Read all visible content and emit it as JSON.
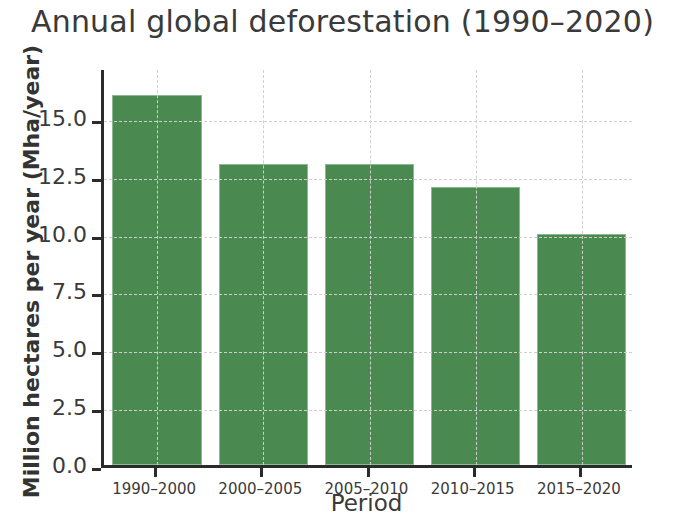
{
  "chart_data": {
    "type": "bar",
    "title": "Annual global deforestation (1990–2020)",
    "xlabel": "Period",
    "ylabel": "Million hectares per year (Mha/year)",
    "categories": [
      "1990–2000",
      "2000–2005",
      "2005–2010",
      "2010–2015",
      "2015–2020"
    ],
    "values": [
      16.0,
      13.0,
      13.0,
      12.0,
      10.0
    ],
    "ylim": [
      0,
      17.2
    ],
    "yticks": [
      0.0,
      2.5,
      5.0,
      7.5,
      10.0,
      12.5,
      15.0
    ],
    "ytick_labels": [
      "0.0",
      "2.5",
      "5.0",
      "7.5",
      "10.0",
      "12.5",
      "15.0"
    ],
    "grid": true,
    "grid_style": "dashed",
    "legend": null,
    "bar_color": "#4a8a50",
    "bar_edge_color": "#8ab98d",
    "axis_color": "#2b2b2b",
    "grid_color": "#cfcfcf",
    "text_color": "#3a3a3a"
  }
}
